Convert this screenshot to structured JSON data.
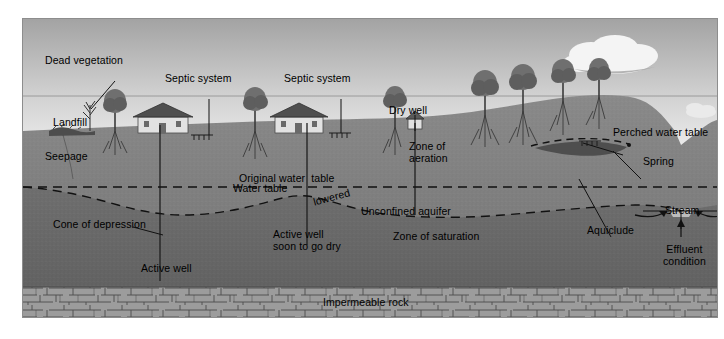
{
  "figure": {
    "frame": {
      "x": 22,
      "y": 18,
      "width": 696,
      "height": 300
    }
  },
  "colors": {
    "sky_top": "#a9a9a9",
    "sky_bottom": "#e9e9e9",
    "haze_line": "#9a9a9a",
    "zone_of_aeration": "#7d7d7d",
    "zone_of_saturation": "#6a6a6a",
    "impermeable_rock": "#9c9c9c",
    "aquiclude": "#5c5c5c",
    "stream_water": "#b9b9b9",
    "cloud": "#f2f2f2",
    "line": "#000000",
    "frame_border": "#8d8d8d"
  },
  "labels": [
    {
      "id": "dead-vegetation",
      "text": "Dead vegetation",
      "x": 44,
      "y": 54,
      "leader": true
    },
    {
      "id": "septic-system-1",
      "text": "Septic system",
      "x": 164,
      "y": 72,
      "leader": true
    },
    {
      "id": "septic-system-2",
      "text": "Septic system",
      "x": 283,
      "y": 72,
      "leader": true
    },
    {
      "id": "landfill",
      "text": "Landfill",
      "x": 52,
      "y": 116,
      "leader": false
    },
    {
      "id": "seepage",
      "text": "Seepage",
      "x": 44,
      "y": 150,
      "leader": false
    },
    {
      "id": "dry-well",
      "text": "Dry well",
      "x": 388,
      "y": 104,
      "leader": true
    },
    {
      "id": "zone-of-aeration",
      "text": "Zone of\naeration",
      "x": 408,
      "y": 140,
      "leader": false
    },
    {
      "id": "perched-water-table",
      "text": "Perched water table",
      "x": 612,
      "y": 127,
      "leader": true
    },
    {
      "id": "spring",
      "text": "Spring",
      "x": 642,
      "y": 156,
      "leader": true
    },
    {
      "id": "original-water-table",
      "text": "Original water  table",
      "x": 238,
      "y": 172,
      "leader": false
    },
    {
      "id": "water-table",
      "text": "Water table",
      "x": 232,
      "y": 182,
      "leader": false
    },
    {
      "id": "lowered",
      "text": "lowered",
      "x": 312,
      "y": 192,
      "leader": false
    },
    {
      "id": "cone-of-depression",
      "text": "Cone of depression",
      "x": 52,
      "y": 218,
      "leader": true
    },
    {
      "id": "unconfined-aquifer",
      "text": "Unconfined aquifer",
      "x": 360,
      "y": 205,
      "leader": false
    },
    {
      "id": "zone-of-saturation",
      "text": "Zone of saturation",
      "x": 392,
      "y": 230,
      "leader": false
    },
    {
      "id": "active-well-1",
      "text": "Active well",
      "x": 140,
      "y": 262,
      "leader": false
    },
    {
      "id": "active-well-2",
      "text": "Active well\nsoon to go dry",
      "x": 272,
      "y": 228,
      "leader": false
    },
    {
      "id": "aquiclude",
      "text": "Aquiclude",
      "x": 586,
      "y": 224,
      "leader": true
    },
    {
      "id": "stream",
      "text": "Stream",
      "x": 664,
      "y": 204,
      "leader": true
    },
    {
      "id": "effluent-condition",
      "text": "Effluent\ncondition",
      "x": 662,
      "y": 243,
      "leader": true
    },
    {
      "id": "impermeable-rock",
      "text": "Impermeable rock",
      "x": 322,
      "y": 296,
      "leader": false
    }
  ],
  "features": {
    "houses": 2,
    "wells_active": 2,
    "wells_dry": 1,
    "septic_fields": 3,
    "clouds": 2,
    "trees": 9,
    "dead_trees": 1
  },
  "water_table_lines": {
    "original": "straight dashed line across full width",
    "lowered": "dashed line with two cones of depression at active wells",
    "perched": "short dashed line over aquiclude lens on right hillside"
  }
}
